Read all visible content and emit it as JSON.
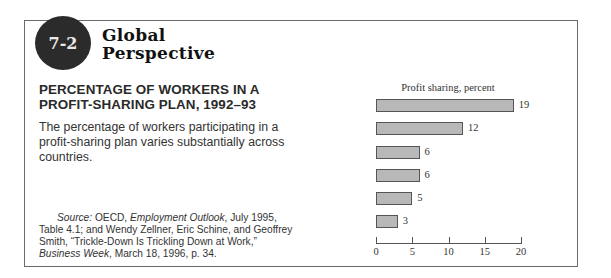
{
  "badge": "7-2",
  "feature_title": [
    "Global",
    "Perspective"
  ],
  "heading": [
    "PERCENTAGE OF WORKERS IN A",
    "PROFIT-SHARING PLAN, 1992–93"
  ],
  "description": "The percentage of workers participating in a profit-sharing plan varies substantially across countries.",
  "source": {
    "label": "Source:",
    "part1": " OECD, ",
    "italic1": "Employment Outlook",
    "part2": ", July 1995, Table 4.1; and Wendy Zellner, Eric Schine, and Geoffrey Smith, “Trickle-Down Is Trickling Down at Work,” ",
    "italic2": "Business Week",
    "part3": ", March 18, 1996, p. 34."
  },
  "chart_data": {
    "type": "bar",
    "orientation": "horizontal",
    "title": "Profit sharing, percent",
    "categories": [
      "France",
      "Canada",
      "United States",
      "Germany",
      "United Kingdom",
      "Australia"
    ],
    "values": [
      19,
      12,
      6,
      6,
      5,
      3
    ],
    "xlabel": "",
    "ylabel": "",
    "xlim": [
      0,
      20
    ],
    "xticks": [
      "0",
      "5",
      "10",
      "15",
      "20"
    ],
    "grid": false,
    "data_labels": true,
    "bar_color": "#b8b8b8"
  }
}
